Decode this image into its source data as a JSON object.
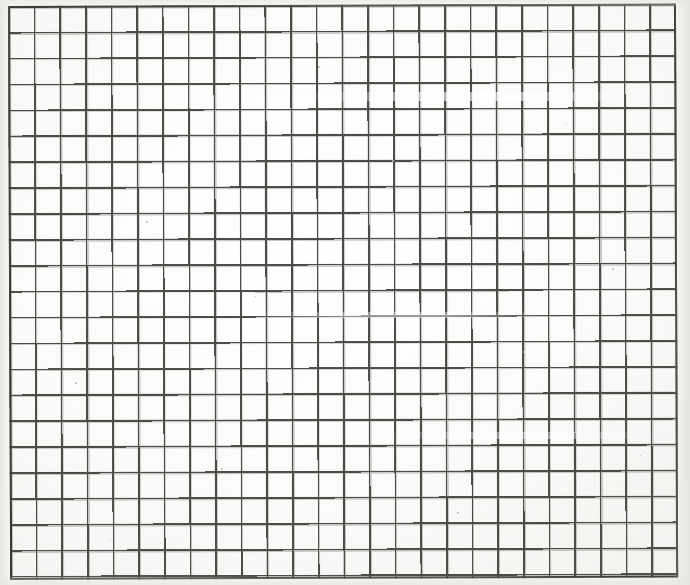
{
  "document": {
    "kind": "scanned-grid-paper",
    "title": "Blank grid / graph paper scan",
    "description": "A scanned sheet of blank square grid paper with a heavier ruled outer border and no text, labels or markings.",
    "text_content": "",
    "width_px": 690,
    "height_px": 585
  },
  "grid": {
    "columns": 26,
    "rows": 22,
    "cell_width_px": 25.65,
    "cell_height_px": 25.9,
    "minor_line_width_px": 1.6,
    "outer_border_width_px": 2.6,
    "line_color": "#55534f",
    "border_color": "#3b3936",
    "cell_fill_color": "#fdfdfc",
    "origin_x_px": 8,
    "origin_y_px": 6,
    "block_width_px": 668,
    "block_height_px": 574,
    "scan_rotation_deg": -0.22,
    "bottom_row_clipped": true
  },
  "page": {
    "background_color": "#ffffff",
    "paper_color": "#fdfdfc",
    "margin_shadow_color": "#e6e6e2"
  },
  "artifacts": {
    "streaks": [
      {
        "name": "upper-scan-streak",
        "x": 300,
        "y": 92,
        "width": 330,
        "height": 9
      },
      {
        "name": "middle-scan-streak",
        "x": 250,
        "y": 312,
        "width": 300,
        "height": 6
      },
      {
        "name": "lower-scan-streak",
        "x": 380,
        "y": 432,
        "width": 280,
        "height": 7
      }
    ],
    "specks": [
      {
        "x": 146,
        "y": 221,
        "size": 2
      },
      {
        "x": 392,
        "y": 160,
        "size": 2
      },
      {
        "x": 523,
        "y": 351,
        "size": 2
      },
      {
        "x": 221,
        "y": 468,
        "size": 2
      },
      {
        "x": 612,
        "y": 268,
        "size": 2
      },
      {
        "x": 75,
        "y": 382,
        "size": 2
      },
      {
        "x": 457,
        "y": 512,
        "size": 2
      },
      {
        "x": 318,
        "y": 66,
        "size": 2
      },
      {
        "x": 255,
        "y": 296,
        "size": 1
      },
      {
        "x": 566,
        "y": 124,
        "size": 1
      },
      {
        "x": 110,
        "y": 540,
        "size": 1
      },
      {
        "x": 640,
        "y": 455,
        "size": 1
      }
    ]
  }
}
